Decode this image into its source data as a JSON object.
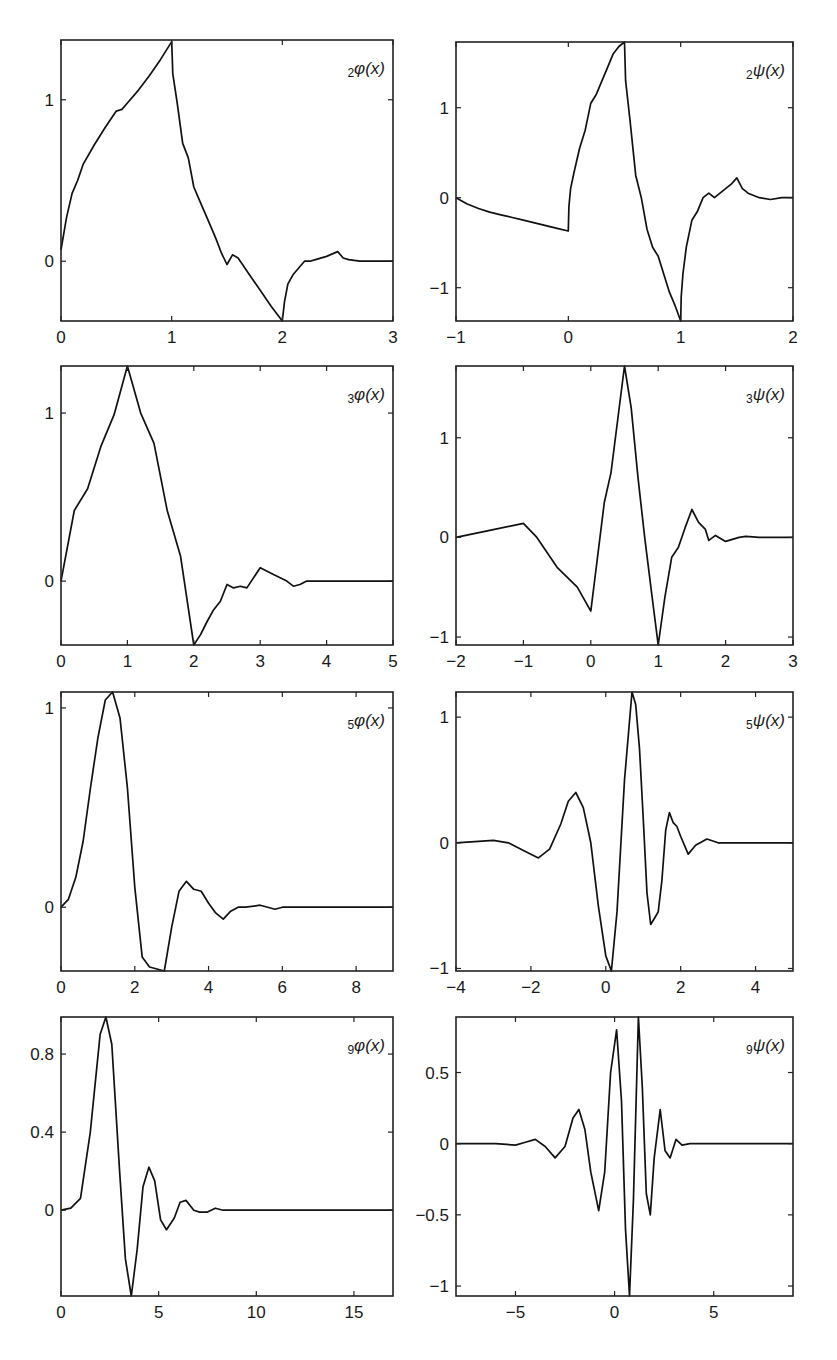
{
  "figure": {
    "layout": {
      "rows": 4,
      "cols": 2
    }
  },
  "chart_data": [
    {
      "type": "line",
      "id": "phi2",
      "label_sub": "2",
      "label_main": "φ(x)",
      "xlim": [
        0,
        3
      ],
      "ylim": [
        -0.37,
        1.37
      ],
      "xticks": [
        0,
        1,
        2,
        3
      ],
      "xticklabels": [
        "0",
        "1",
        "2",
        "3"
      ],
      "yticks": [
        0,
        1
      ],
      "yticklabels": [
        "0",
        "1"
      ],
      "frame": {
        "left": 61,
        "top": 40,
        "right": 393,
        "bottom": 321
      },
      "x": [
        0,
        0.05,
        0.1,
        0.15,
        0.2,
        0.3,
        0.4,
        0.5,
        0.55,
        0.6,
        0.7,
        0.8,
        0.9,
        1.0,
        1.01,
        1.05,
        1.1,
        1.15,
        1.2,
        1.25,
        1.3,
        1.35,
        1.4,
        1.45,
        1.5,
        1.55,
        1.6,
        1.7,
        1.8,
        1.9,
        2.0,
        2.02,
        2.05,
        2.1,
        2.15,
        2.2,
        2.25,
        2.3,
        2.4,
        2.5,
        2.55,
        2.6,
        2.7,
        2.8,
        2.9,
        3.0
      ],
      "y": [
        0.07,
        0.27,
        0.42,
        0.5,
        0.6,
        0.72,
        0.83,
        0.93,
        0.94,
        0.98,
        1.06,
        1.15,
        1.25,
        1.36,
        1.16,
        0.98,
        0.73,
        0.64,
        0.46,
        0.38,
        0.3,
        0.22,
        0.14,
        0.05,
        -0.02,
        0.04,
        0.02,
        -0.08,
        -0.18,
        -0.28,
        -0.37,
        -0.25,
        -0.14,
        -0.08,
        -0.04,
        0.0,
        0.0,
        0.01,
        0.03,
        0.06,
        0.02,
        0.01,
        0.0,
        0.0,
        0.0,
        0.0
      ]
    },
    {
      "type": "line",
      "id": "psi2",
      "label_sub": "2",
      "label_main": "ψ(x)",
      "xlim": [
        -1,
        2
      ],
      "ylim": [
        -1.37,
        1.73
      ],
      "xticks": [
        -1,
        0,
        1,
        2
      ],
      "xticklabels": [
        "−1",
        "0",
        "1",
        "2"
      ],
      "yticks": [
        -1,
        0,
        1
      ],
      "yticklabels": [
        "−1",
        "0",
        "1"
      ],
      "frame": {
        "left": 456,
        "top": 42,
        "right": 793,
        "bottom": 321
      },
      "x": [
        -1.0,
        -0.9,
        -0.8,
        -0.7,
        -0.6,
        -0.5,
        -0.4,
        -0.3,
        -0.2,
        -0.1,
        0.0,
        0.005,
        0.02,
        0.05,
        0.1,
        0.15,
        0.2,
        0.25,
        0.3,
        0.35,
        0.4,
        0.45,
        0.5,
        0.51,
        0.55,
        0.6,
        0.65,
        0.7,
        0.75,
        0.8,
        0.85,
        0.9,
        0.95,
        1.0,
        1.005,
        1.02,
        1.05,
        1.1,
        1.15,
        1.2,
        1.25,
        1.3,
        1.35,
        1.4,
        1.45,
        1.5,
        1.55,
        1.6,
        1.7,
        1.8,
        1.9,
        2.0
      ],
      "y": [
        0.0,
        -0.07,
        -0.12,
        -0.16,
        -0.19,
        -0.22,
        -0.25,
        -0.28,
        -0.31,
        -0.34,
        -0.37,
        -0.1,
        0.1,
        0.28,
        0.55,
        0.75,
        1.05,
        1.15,
        1.3,
        1.45,
        1.6,
        1.68,
        1.73,
        1.3,
        0.85,
        0.25,
        0.0,
        -0.35,
        -0.55,
        -0.65,
        -0.85,
        -1.05,
        -1.2,
        -1.37,
        -1.1,
        -0.85,
        -0.55,
        -0.25,
        -0.15,
        0.0,
        0.05,
        0.0,
        0.05,
        0.1,
        0.15,
        0.22,
        0.1,
        0.05,
        0.0,
        -0.02,
        0.0,
        0.0
      ]
    },
    {
      "type": "line",
      "id": "phi3",
      "label_sub": "3",
      "label_main": "φ(x)",
      "xlim": [
        0,
        5
      ],
      "ylim": [
        -0.38,
        1.28
      ],
      "xticks": [
        0,
        1,
        2,
        3,
        4,
        5
      ],
      "xticklabels": [
        "0",
        "1",
        "2",
        "3",
        "4",
        "5"
      ],
      "yticks": [
        0,
        1
      ],
      "yticklabels": [
        "0",
        "1"
      ],
      "frame": {
        "left": 61,
        "top": 366,
        "right": 393,
        "bottom": 645
      },
      "x": [
        0,
        0.2,
        0.4,
        0.6,
        0.8,
        1.0,
        1.2,
        1.4,
        1.6,
        1.8,
        2.0,
        2.1,
        2.2,
        2.3,
        2.4,
        2.5,
        2.6,
        2.7,
        2.8,
        3.0,
        3.2,
        3.4,
        3.5,
        3.6,
        3.7,
        4.0,
        4.5,
        5.0
      ],
      "y": [
        0.0,
        0.42,
        0.55,
        0.8,
        0.99,
        1.28,
        1.0,
        0.82,
        0.42,
        0.15,
        -0.38,
        -0.32,
        -0.24,
        -0.17,
        -0.12,
        -0.02,
        -0.04,
        -0.03,
        -0.04,
        0.08,
        0.04,
        0.0,
        -0.03,
        -0.02,
        0.0,
        0.0,
        0.0,
        0.0
      ]
    },
    {
      "type": "line",
      "id": "psi3",
      "label_sub": "3",
      "label_main": "ψ(x)",
      "xlim": [
        -2,
        3
      ],
      "ylim": [
        -1.08,
        1.72
      ],
      "xticks": [
        -2,
        -1,
        0,
        1,
        2,
        3
      ],
      "xticklabels": [
        "−2",
        "−1",
        "0",
        "1",
        "2",
        "3"
      ],
      "yticks": [
        -1,
        0,
        1
      ],
      "yticklabels": [
        "−1",
        "0",
        "1"
      ],
      "frame": {
        "left": 456,
        "top": 366,
        "right": 793,
        "bottom": 645
      },
      "x": [
        -2.0,
        -1.5,
        -1.0,
        -0.8,
        -0.5,
        -0.2,
        0.0,
        0.1,
        0.2,
        0.3,
        0.5,
        0.6,
        0.7,
        0.8,
        0.9,
        1.0,
        1.1,
        1.2,
        1.25,
        1.3,
        1.4,
        1.5,
        1.6,
        1.7,
        1.75,
        1.85,
        2.0,
        2.2,
        2.3,
        2.5,
        3.0
      ],
      "y": [
        0.0,
        0.07,
        0.14,
        0.0,
        -0.3,
        -0.5,
        -0.74,
        -0.2,
        0.35,
        0.65,
        1.72,
        1.3,
        0.6,
        0.0,
        -0.55,
        -1.08,
        -0.6,
        -0.2,
        -0.15,
        -0.1,
        0.1,
        0.28,
        0.15,
        0.08,
        -0.03,
        0.02,
        -0.04,
        0.0,
        0.01,
        0.0,
        0.0
      ]
    },
    {
      "type": "line",
      "id": "phi5",
      "label_sub": "5",
      "label_main": "φ(x)",
      "xlim": [
        0,
        9
      ],
      "ylim": [
        -0.32,
        1.08
      ],
      "xticks": [
        0,
        2,
        4,
        6,
        8
      ],
      "xticklabels": [
        "0",
        "2",
        "4",
        "6",
        "8"
      ],
      "yticks": [
        0,
        1
      ],
      "yticklabels": [
        "0",
        "1"
      ],
      "frame": {
        "left": 61,
        "top": 692,
        "right": 393,
        "bottom": 971
      },
      "x": [
        0,
        0.2,
        0.4,
        0.6,
        0.8,
        1.0,
        1.2,
        1.4,
        1.6,
        1.8,
        2.0,
        2.2,
        2.4,
        2.6,
        2.8,
        3.0,
        3.2,
        3.4,
        3.6,
        3.8,
        4.0,
        4.2,
        4.4,
        4.6,
        4.8,
        5.0,
        5.4,
        5.8,
        6.0,
        7.0,
        8.0,
        9.0
      ],
      "y": [
        0.0,
        0.04,
        0.15,
        0.33,
        0.6,
        0.85,
        1.04,
        1.08,
        0.95,
        0.6,
        0.1,
        -0.25,
        -0.3,
        -0.31,
        -0.32,
        -0.1,
        0.08,
        0.13,
        0.09,
        0.08,
        0.02,
        -0.03,
        -0.06,
        -0.02,
        0.0,
        0.0,
        0.01,
        -0.01,
        0.0,
        0.0,
        0.0,
        0.0
      ]
    },
    {
      "type": "line",
      "id": "psi5",
      "label_sub": "5",
      "label_main": "ψ(x)",
      "xlim": [
        -4,
        5
      ],
      "ylim": [
        -1.02,
        1.2
      ],
      "xticks": [
        -4,
        -2,
        0,
        2,
        4
      ],
      "xticklabels": [
        "−4",
        "−2",
        "0",
        "2",
        "4"
      ],
      "yticks": [
        -1,
        0,
        1
      ],
      "yticklabels": [
        "−1",
        "0",
        "1"
      ],
      "frame": {
        "left": 456,
        "top": 692,
        "right": 793,
        "bottom": 971
      },
      "x": [
        -4.0,
        -3.5,
        -3.0,
        -2.6,
        -2.2,
        -1.8,
        -1.5,
        -1.2,
        -1.0,
        -0.8,
        -0.6,
        -0.4,
        -0.2,
        0.0,
        0.15,
        0.3,
        0.5,
        0.7,
        0.8,
        0.9,
        1.0,
        1.1,
        1.2,
        1.3,
        1.4,
        1.5,
        1.6,
        1.7,
        1.8,
        1.9,
        2.0,
        2.2,
        2.4,
        2.7,
        3.0,
        4.0,
        5.0
      ],
      "y": [
        0.0,
        0.01,
        0.02,
        0.0,
        -0.06,
        -0.12,
        -0.05,
        0.15,
        0.33,
        0.4,
        0.28,
        0.0,
        -0.5,
        -0.9,
        -1.02,
        -0.55,
        0.5,
        1.2,
        1.1,
        0.75,
        0.2,
        -0.4,
        -0.65,
        -0.6,
        -0.55,
        -0.3,
        0.1,
        0.24,
        0.16,
        0.13,
        0.05,
        -0.09,
        -0.02,
        0.03,
        0.0,
        0.0,
        0.0
      ]
    },
    {
      "type": "line",
      "id": "phi9",
      "label_sub": "9",
      "label_main": "φ(x)",
      "xlim": [
        0,
        17
      ],
      "ylim": [
        -0.44,
        0.99
      ],
      "xticks": [
        0,
        5,
        10,
        15
      ],
      "xticklabels": [
        "0",
        "5",
        "10",
        "15"
      ],
      "yticks": [
        0,
        0.4,
        0.8
      ],
      "yticklabels": [
        "0",
        "0.4",
        "0.8"
      ],
      "frame": {
        "left": 61,
        "top": 1017,
        "right": 393,
        "bottom": 1296
      },
      "x": [
        0,
        0.5,
        1.0,
        1.5,
        2.0,
        2.3,
        2.6,
        3.0,
        3.3,
        3.6,
        3.9,
        4.2,
        4.5,
        4.8,
        5.1,
        5.4,
        5.8,
        6.1,
        6.4,
        6.8,
        7.1,
        7.5,
        7.9,
        8.3,
        9.0,
        12.0,
        17.0
      ],
      "y": [
        0.0,
        0.01,
        0.06,
        0.4,
        0.9,
        0.99,
        0.85,
        0.2,
        -0.25,
        -0.44,
        -0.2,
        0.12,
        0.22,
        0.15,
        -0.05,
        -0.1,
        -0.04,
        0.04,
        0.05,
        0.0,
        -0.01,
        -0.01,
        0.01,
        0.0,
        0.0,
        0.0,
        0.0
      ]
    },
    {
      "type": "line",
      "id": "psi9",
      "label_sub": "9",
      "label_main": "ψ(x)",
      "xlim": [
        -8,
        9
      ],
      "ylim": [
        -1.07,
        0.89
      ],
      "xticks": [
        -5,
        0,
        5
      ],
      "xticklabels": [
        "−5",
        "0",
        "5"
      ],
      "yticks": [
        -1,
        -0.5,
        0,
        0.5
      ],
      "yticklabels": [
        "−1",
        "−0.5",
        "0",
        "0.5"
      ],
      "frame": {
        "left": 456,
        "top": 1017,
        "right": 793,
        "bottom": 1296
      },
      "x": [
        -8.0,
        -6.0,
        -5.0,
        -4.5,
        -4.0,
        -3.5,
        -3.0,
        -2.5,
        -2.1,
        -1.8,
        -1.5,
        -1.2,
        -0.8,
        -0.5,
        -0.2,
        0.1,
        0.35,
        0.55,
        0.75,
        0.95,
        1.2,
        1.4,
        1.6,
        1.8,
        2.0,
        2.3,
        2.55,
        2.8,
        3.1,
        3.4,
        3.8,
        5.0,
        9.0
      ],
      "y": [
        0.0,
        0.0,
        -0.01,
        0.01,
        0.03,
        -0.02,
        -0.1,
        -0.02,
        0.18,
        0.24,
        0.1,
        -0.2,
        -0.47,
        -0.2,
        0.5,
        0.8,
        0.3,
        -0.6,
        -1.07,
        -0.4,
        0.89,
        0.4,
        -0.35,
        -0.5,
        -0.1,
        0.24,
        -0.05,
        -0.1,
        0.03,
        -0.01,
        0.0,
        0.0,
        0.0
      ]
    }
  ]
}
